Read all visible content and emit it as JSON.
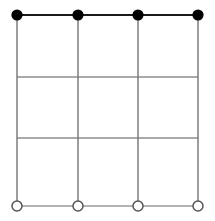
{
  "figure": {
    "title": "",
    "type": "grid-diagram",
    "canvas": {
      "width": 215,
      "height": 221,
      "background": "#ffffff"
    },
    "grid": {
      "columns": 3,
      "rows": 3,
      "x_positions": [
        17,
        78,
        138,
        198
      ],
      "y_positions": [
        15,
        77,
        138,
        206
      ],
      "line_color": "#8c8c8c",
      "line_color_emphasis": "#1a1a1a",
      "line_width": 1.6
    },
    "horizontal_lines": [
      {
        "id": "h-top",
        "y": 15,
        "x1": 17,
        "x2": 198,
        "color": "#1a1a1a",
        "width": 1.8
      },
      {
        "id": "h-mid-upper",
        "y": 77,
        "x1": 17,
        "x2": 198,
        "color": "#8c8c8c",
        "width": 1.4
      },
      {
        "id": "h-mid-lower",
        "y": 138,
        "x1": 17,
        "x2": 198,
        "color": "#8c8c8c",
        "width": 1.4
      },
      {
        "id": "h-bottom",
        "y": 206,
        "x1": 17,
        "x2": 198,
        "color": "#9a9a9a",
        "width": 1.4
      }
    ],
    "vertical_lines": [
      {
        "id": "v-1",
        "x": 17,
        "y1": 15,
        "y2": 206,
        "color": "#7d7d7d",
        "width": 1.5
      },
      {
        "id": "v-2",
        "x": 78,
        "y1": 15,
        "y2": 206,
        "color": "#7d7d7d",
        "width": 1.5
      },
      {
        "id": "v-3",
        "x": 138,
        "y1": 15,
        "y2": 206,
        "color": "#7d7d7d",
        "width": 1.5
      },
      {
        "id": "v-4",
        "x": 198,
        "y1": 15,
        "y2": 206,
        "color": "#7d7d7d",
        "width": 1.5
      }
    ],
    "nodes_filled": [
      {
        "id": "top-1",
        "cx": 17,
        "cy": 15,
        "r": 5.6,
        "fill": "#000000",
        "label": ""
      },
      {
        "id": "top-2",
        "cx": 78,
        "cy": 15,
        "r": 5.6,
        "fill": "#000000",
        "label": ""
      },
      {
        "id": "top-3",
        "cx": 138,
        "cy": 15,
        "r": 5.6,
        "fill": "#000000",
        "label": ""
      },
      {
        "id": "top-4",
        "cx": 198,
        "cy": 15,
        "r": 5.6,
        "fill": "#000000",
        "label": ""
      }
    ],
    "nodes_hollow": [
      {
        "id": "bottom-1",
        "cx": 17,
        "cy": 206,
        "r": 5.0,
        "fill": "#ffffff",
        "stroke": "#555555",
        "label": ""
      },
      {
        "id": "bottom-2",
        "cx": 78,
        "cy": 206,
        "r": 5.0,
        "fill": "#ffffff",
        "stroke": "#555555",
        "label": ""
      },
      {
        "id": "bottom-3",
        "cx": 138,
        "cy": 206,
        "r": 5.0,
        "fill": "#ffffff",
        "stroke": "#555555",
        "label": ""
      },
      {
        "id": "bottom-4",
        "cx": 198,
        "cy": 206,
        "r": 5.0,
        "fill": "#ffffff",
        "stroke": "#555555",
        "label": ""
      }
    ]
  }
}
